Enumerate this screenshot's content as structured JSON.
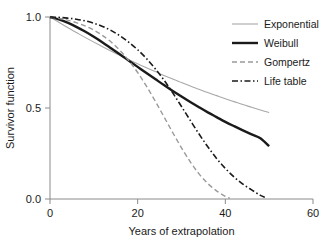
{
  "chart_data": {
    "type": "line",
    "title": "",
    "xlabel": "Years of extrapolation",
    "ylabel": "Survivor function",
    "xlim": [
      0,
      60
    ],
    "ylim": [
      0,
      1
    ],
    "xticks": [
      0,
      20,
      40,
      60
    ],
    "xtick_labels": [
      "0",
      "20",
      "40",
      "60"
    ],
    "yticks": [
      0.0,
      0.5,
      1.0
    ],
    "ytick_labels": [
      "0.0",
      "0.5",
      "1.0"
    ],
    "grid": false,
    "legend_position": "top-right",
    "series": [
      {
        "name": "Exponential",
        "color": "#a8a8a8",
        "style": "solid",
        "width": 1.1,
        "x": [
          0,
          2,
          4,
          6,
          8,
          10,
          12,
          14,
          16,
          18,
          20,
          22,
          24,
          26,
          28,
          30,
          32,
          34,
          36,
          38,
          40,
          42,
          44,
          46,
          48,
          50
        ],
        "y": [
          1.0,
          0.971,
          0.942,
          0.915,
          0.888,
          0.862,
          0.837,
          0.812,
          0.788,
          0.765,
          0.743,
          0.721,
          0.7,
          0.679,
          0.659,
          0.64,
          0.621,
          0.603,
          0.585,
          0.568,
          0.551,
          0.535,
          0.519,
          0.504,
          0.489,
          0.475
        ]
      },
      {
        "name": "Weibull",
        "color": "#1a1a1a",
        "style": "solid",
        "width": 2.4,
        "x": [
          0,
          2,
          4,
          6,
          8,
          10,
          12,
          14,
          16,
          18,
          20,
          22,
          24,
          26,
          28,
          30,
          32,
          34,
          36,
          38,
          40,
          42,
          44,
          46,
          48,
          50
        ],
        "y": [
          1.0,
          0.987,
          0.969,
          0.946,
          0.92,
          0.891,
          0.86,
          0.827,
          0.794,
          0.76,
          0.726,
          0.692,
          0.659,
          0.626,
          0.594,
          0.563,
          0.533,
          0.504,
          0.476,
          0.45,
          0.424,
          0.4,
          0.377,
          0.355,
          0.334,
          0.29
        ]
      },
      {
        "name": "Gompertz",
        "color": "#9a9a9a",
        "style": "dashed",
        "width": 1.4,
        "x": [
          0,
          2,
          4,
          6,
          8,
          10,
          12,
          14,
          16,
          18,
          20,
          22,
          24,
          26,
          28,
          30,
          32,
          34,
          36,
          38,
          40,
          41
        ],
        "y": [
          1.0,
          0.993,
          0.983,
          0.969,
          0.951,
          0.928,
          0.898,
          0.861,
          0.815,
          0.76,
          0.695,
          0.62,
          0.538,
          0.452,
          0.365,
          0.281,
          0.204,
          0.138,
          0.085,
          0.045,
          0.015,
          0.004
        ]
      },
      {
        "name": "Life table",
        "color": "#1a1a1a",
        "style": "dashdot",
        "width": 1.6,
        "x": [
          0,
          2,
          4,
          6,
          8,
          10,
          12,
          14,
          16,
          18,
          20,
          22,
          24,
          26,
          28,
          30,
          32,
          34,
          36,
          38,
          40,
          42,
          44,
          46,
          48,
          49
        ],
        "y": [
          1.0,
          0.998,
          0.994,
          0.988,
          0.979,
          0.966,
          0.948,
          0.925,
          0.896,
          0.861,
          0.82,
          0.772,
          0.716,
          0.653,
          0.583,
          0.508,
          0.432,
          0.357,
          0.287,
          0.223,
          0.168,
          0.121,
          0.082,
          0.05,
          0.02,
          0.01
        ]
      }
    ]
  },
  "legend": {
    "items": [
      {
        "label": "Exponential"
      },
      {
        "label": "Weibull"
      },
      {
        "label": "Gompertz"
      },
      {
        "label": "Life table"
      }
    ]
  }
}
